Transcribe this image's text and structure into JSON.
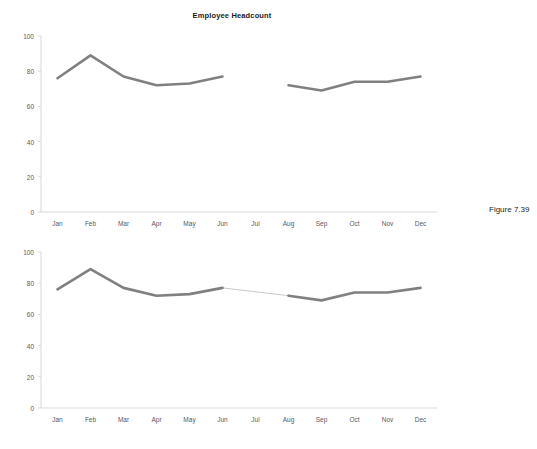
{
  "figure": {
    "caption": "Figure 7.39"
  },
  "chart_data": [
    {
      "id": "chart-1",
      "type": "line",
      "title": "Employee Headcount",
      "xlabel": "",
      "ylabel": "",
      "categories": [
        "Jan",
        "Feb",
        "Mar",
        "Apr",
        "May",
        "Jun",
        "Jul",
        "Aug",
        "Sep",
        "Oct",
        "Nov",
        "Dec"
      ],
      "values": [
        76,
        89,
        77,
        72,
        73,
        77,
        null,
        72,
        69,
        74,
        74,
        77
      ],
      "missing_category": "Jul",
      "gap_handling": "break",
      "connect_gap": false,
      "ylim": [
        0,
        100
      ],
      "yticks": [
        0,
        20,
        40,
        60,
        80,
        100
      ],
      "grid": false,
      "legend": false,
      "series_color": "#808080",
      "axis_color": "#d9d9d9",
      "tick_label_color": "#58595b"
    },
    {
      "id": "chart-2",
      "type": "line",
      "title": "",
      "xlabel": "",
      "ylabel": "",
      "categories": [
        "Jan",
        "Feb",
        "Mar",
        "Apr",
        "May",
        "Jun",
        "Jul",
        "Aug",
        "Sep",
        "Oct",
        "Nov",
        "Dec"
      ],
      "values": [
        76,
        89,
        77,
        72,
        73,
        77,
        null,
        72,
        69,
        74,
        74,
        77
      ],
      "missing_category": "Jul",
      "gap_handling": "connect",
      "connect_gap": true,
      "connector_color": "#c8c8c8",
      "ylim": [
        0,
        100
      ],
      "yticks": [
        0,
        20,
        40,
        60,
        80,
        100
      ],
      "grid": false,
      "legend": false,
      "series_color": "#808080",
      "axis_color": "#d9d9d9",
      "tick_label_color": "#58595b"
    }
  ]
}
